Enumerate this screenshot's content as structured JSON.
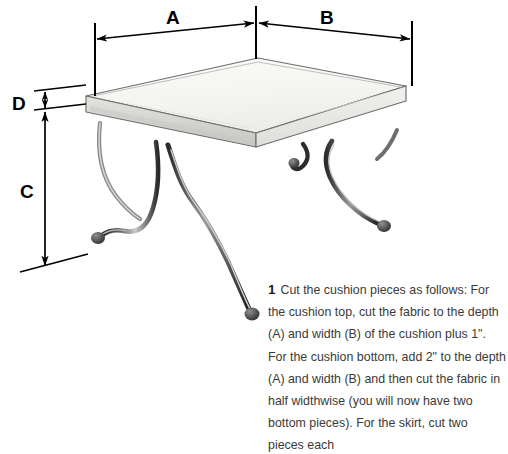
{
  "page": {
    "background_color": "#ffffff",
    "width": 508,
    "height": 454,
    "kind": "sewing-instruction-diagram"
  },
  "illustration": {
    "subject": "upholstered bench with cushion top and curved X-shaped metal legs",
    "name": "bench-stool-drawing",
    "line_color": "#2b2b2b",
    "cushion_fill": "#f2f2f0",
    "cushion_side_fill": "#d9d9d6",
    "leg_color": "#3b3b3b"
  },
  "dimensions": {
    "labels": [
      {
        "id": "A",
        "text": "A",
        "meaning": "depth of cushion",
        "orientation": "horizontal-left"
      },
      {
        "id": "B",
        "text": "B",
        "meaning": "width of cushion",
        "orientation": "horizontal-right"
      },
      {
        "id": "C",
        "text": "C",
        "meaning": "leg height",
        "orientation": "vertical"
      },
      {
        "id": "D",
        "text": "D",
        "meaning": "cushion thickness",
        "orientation": "vertical-short"
      }
    ],
    "arrow_color": "#000000"
  },
  "instruction": {
    "number": "1",
    "body": "Cut the cushion pieces as follows: For the cushion top, cut the fabric to the depth (A) and width (B) of the cushion plus 1\". For the cushion bottom, add 2\" to the depth (A) and width (B) and then cut the fabric in half widthwise (you will now have two bottom pieces). For the skirt, cut two pieces each",
    "text_color": "#3a3a3a"
  }
}
